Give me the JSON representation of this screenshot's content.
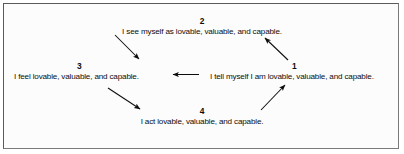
{
  "diagram": {
    "background_color": "#fcfcfc",
    "border_color": "#5a5a5a",
    "text_color": "#0d0d0d",
    "nodes": [
      {
        "id": "1",
        "label": "1",
        "text": "I tell myself I am lovable, valuable, and capable.",
        "position": "right"
      },
      {
        "id": "2",
        "label": "2",
        "text": "I see myself as lovable, valuable, and capable.",
        "position": "top"
      },
      {
        "id": "3",
        "label": "3",
        "text": "I feel lovable, valuable, and capable.",
        "position": "left"
      },
      {
        "id": "4",
        "label": "4",
        "text": "I act lovable, valuable, and capable.",
        "position": "bottom"
      }
    ],
    "arrows": [
      {
        "from": "1",
        "to": "2",
        "direction": "up-left",
        "style": "solid"
      },
      {
        "from": "2",
        "to": "3",
        "direction": "down-left",
        "style": "solid"
      },
      {
        "from": "3",
        "to": "4",
        "direction": "down-right",
        "style": "solid"
      },
      {
        "from": "4",
        "to": "1",
        "direction": "up-right",
        "style": "solid"
      },
      {
        "from": "1",
        "to": "3",
        "direction": "left",
        "style": "solid"
      }
    ]
  }
}
